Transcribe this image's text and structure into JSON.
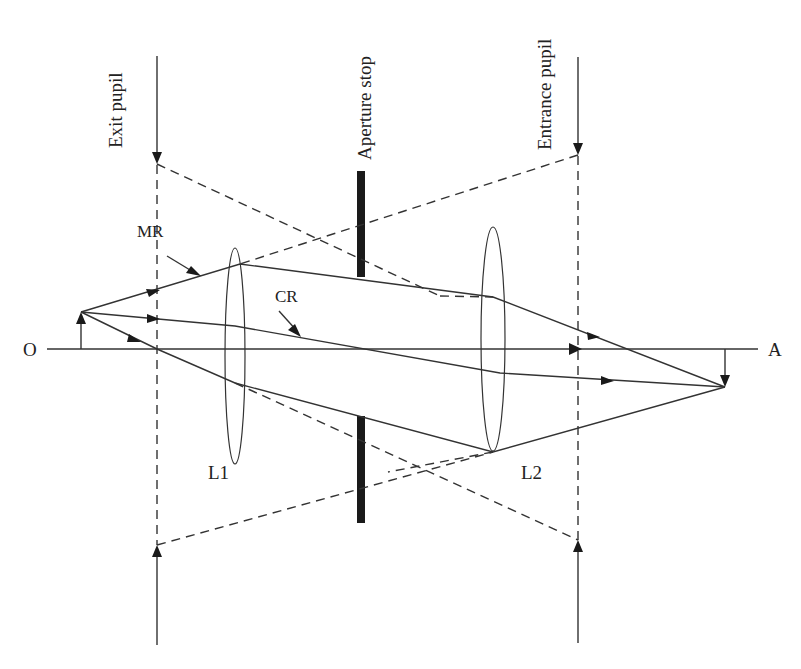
{
  "diagram": {
    "labels": {
      "exit_pupil": "Exit pupil",
      "aperture_stop": "Aperture stop",
      "entrance_pupil": "Entrance pupil",
      "marginal_ray": "MR",
      "chief_ray": "CR",
      "object": "O",
      "axis_end": "A",
      "lens1": "L1",
      "lens2": "L2"
    },
    "colors": {
      "line": "#333333",
      "stop": "#1a1a1a",
      "background": "#ffffff"
    }
  }
}
